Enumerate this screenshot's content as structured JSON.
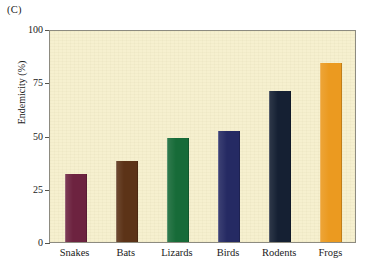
{
  "figure": {
    "panel_label": "(C)",
    "background_color": "#ffffff",
    "plot_background_color": "#f6f0cf",
    "frame_color": "#8d8b80"
  },
  "chart_data": {
    "type": "bar",
    "title": "",
    "subtitle": "",
    "xlabel": "",
    "ylabel": "Endemicity (%)",
    "categories": [
      "Snakes",
      "Bats",
      "Lizards",
      "Birds",
      "Rodents",
      "Frogs"
    ],
    "values": [
      32,
      38,
      49,
      52,
      71,
      84
    ],
    "bar_colors": [
      "#6d2340",
      "#5c3317",
      "#176b38",
      "#252a63",
      "#152033",
      "#eb9a20"
    ],
    "ylim": [
      0,
      100
    ],
    "yticks": [
      0,
      25,
      50,
      75,
      100
    ],
    "ytick_labels": [
      "0",
      "25",
      "50",
      "75",
      "100"
    ],
    "grid": false,
    "legend": null,
    "annotations": [],
    "series": [
      {
        "name": "Endemicity",
        "values": [
          32,
          38,
          49,
          52,
          71,
          84
        ]
      }
    ]
  }
}
